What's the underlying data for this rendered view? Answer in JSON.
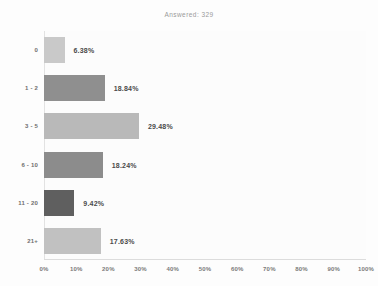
{
  "chart_data": {
    "type": "bar",
    "orientation": "horizontal",
    "title": "Answered: 329",
    "xlabel": "",
    "ylabel": "",
    "categories": [
      "0",
      "1 - 2",
      "3 - 5",
      "6 - 10",
      "11 - 20",
      "21+"
    ],
    "values": [
      6.38,
      18.84,
      29.48,
      18.24,
      9.42,
      17.63
    ],
    "value_labels": [
      "6.38%",
      "18.84%",
      "29.48%",
      "18.24%",
      "9.42%",
      "17.63%"
    ],
    "bar_colors": [
      "#c9c9c9",
      "#8f8f8f",
      "#b9b9b9",
      "#8c8c8c",
      "#5f5f5f",
      "#c1c1c1"
    ],
    "xlim": [
      0,
      100
    ],
    "xticks": [
      0,
      10,
      20,
      30,
      40,
      50,
      60,
      70,
      80,
      90,
      100
    ],
    "xtick_labels": [
      "0%",
      "10%",
      "20%",
      "30%",
      "40%",
      "50%",
      "60%",
      "70%",
      "80%",
      "90%",
      "100%"
    ],
    "grid": false,
    "legend": null
  },
  "colors": {
    "background": "#fdfdfd",
    "plot_background": "#fcfcfc",
    "title_text": "#9a9a9a",
    "value_text": "#4a4a4a",
    "tick_text": "#7a7a7a",
    "category_text": "#6e6e6e",
    "axis_line": "#e2e2e2"
  }
}
